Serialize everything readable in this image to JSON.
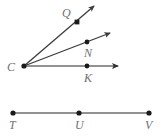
{
  "figure": {
    "background_color": "#ffffff",
    "label_color": "#6f6f6f",
    "ray_color": "#3a3a3a",
    "segment_color": "#6e6e6e",
    "dot_color": "#1a1a1a",
    "labels": {
      "C": "C",
      "Q": "Q",
      "N": "N",
      "K": "K",
      "T": "T",
      "U": "U",
      "V": "V"
    },
    "vertex": {
      "name": "C",
      "x": 24,
      "y": 66
    },
    "rays": [
      {
        "name": "ray-CQ",
        "through_point": "Q",
        "from_x": 24,
        "from_y": 66,
        "to_x": 94,
        "to_y": 6,
        "dot_x": 77,
        "dot_y": 22
      },
      {
        "name": "ray-CN",
        "through_point": "N",
        "from_x": 24,
        "from_y": 66,
        "to_x": 110,
        "to_y": 33,
        "dot_x": 87,
        "dot_y": 42
      },
      {
        "name": "ray-CK",
        "through_point": "K",
        "from_x": 24,
        "from_y": 66,
        "to_x": 118,
        "to_y": 66,
        "dot_x": 87,
        "dot_y": 66
      }
    ],
    "segment": {
      "name": "segment-TV",
      "from_x": 13,
      "from_y": 113,
      "to_x": 149,
      "to_y": 113,
      "points": [
        {
          "name": "T",
          "x": 13,
          "y": 113
        },
        {
          "name": "U",
          "x": 79,
          "y": 113
        },
        {
          "name": "V",
          "x": 149,
          "y": 113
        }
      ]
    },
    "label_positions": {
      "C": {
        "x": 7,
        "y": 61
      },
      "Q": {
        "x": 62,
        "y": 7
      },
      "N": {
        "x": 84,
        "y": 47
      },
      "K": {
        "x": 84,
        "y": 72
      },
      "T": {
        "x": 9,
        "y": 119
      },
      "U": {
        "x": 75,
        "y": 119
      },
      "V": {
        "x": 145,
        "y": 119
      }
    }
  }
}
